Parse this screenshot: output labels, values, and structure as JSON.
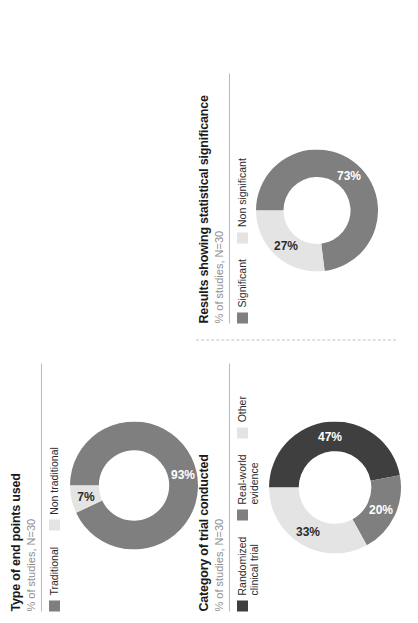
{
  "figure": {
    "orientation": "rotated-90-ccw",
    "background": "#ffffff",
    "colors": {
      "dark": "#3f3f3f",
      "medium": "#7f7f7f",
      "light": "#e4e4e4",
      "title": "#1a1a1a",
      "subtitle": "#8e8e8e",
      "rule": "#b9b9b9",
      "divider": "#c2c2c2"
    }
  },
  "panels": {
    "endpoints": {
      "title": "Type of end points used",
      "subtitle": "% of studies, N=30",
      "legend": [
        {
          "label": "Traditional",
          "color": "#7f7f7f"
        },
        {
          "label": "Non traditional",
          "color": "#e4e4e4"
        }
      ]
    },
    "category": {
      "title": "Category of trial conducted",
      "subtitle": "% of studies, N=30",
      "legend": [
        {
          "label": "Randomized\nclinical trial",
          "color": "#3f3f3f"
        },
        {
          "label": "Real-world\nevidence",
          "color": "#7f7f7f"
        },
        {
          "label": "Other",
          "color": "#e4e4e4"
        }
      ]
    },
    "results": {
      "title": "Results showing statistical significance",
      "subtitle": "% of studies, N=30",
      "legend": [
        {
          "label": "Significant",
          "color": "#7f7f7f"
        },
        {
          "label": "Non significant",
          "color": "#e4e4e4"
        }
      ]
    }
  },
  "chart_data": [
    {
      "type": "pie",
      "id": "endpoints",
      "title": "Type of end points used",
      "subtitle": "% of studies, N=30",
      "donut": true,
      "hole_ratio": 0.55,
      "categories": [
        "Traditional",
        "Non traditional"
      ],
      "values": [
        93,
        7
      ],
      "labels": [
        "93%",
        "7%"
      ],
      "colors": [
        "#7f7f7f",
        "#e4e4e4"
      ],
      "label_colors": [
        "#ffffff",
        "#2b2b2b"
      ],
      "units": "percent",
      "n": 30
    },
    {
      "type": "pie",
      "id": "category",
      "title": "Category of trial conducted",
      "subtitle": "% of studies, N=30",
      "donut": true,
      "hole_ratio": 0.55,
      "categories": [
        "Randomized clinical trial",
        "Real-world evidence",
        "Other"
      ],
      "values": [
        47,
        20,
        33
      ],
      "labels": [
        "47%",
        "20%",
        "33%"
      ],
      "colors": [
        "#3f3f3f",
        "#7f7f7f",
        "#e4e4e4"
      ],
      "label_colors": [
        "#ffffff",
        "#ffffff",
        "#2b2b2b"
      ],
      "units": "percent",
      "n": 30
    },
    {
      "type": "pie",
      "id": "results",
      "title": "Results showing statistical significance",
      "subtitle": "% of studies, N=30",
      "donut": true,
      "hole_ratio": 0.55,
      "categories": [
        "Significant",
        "Non significant"
      ],
      "values": [
        73,
        27
      ],
      "labels": [
        "73%",
        "27%"
      ],
      "colors": [
        "#7f7f7f",
        "#e4e4e4"
      ],
      "label_colors": [
        "#ffffff",
        "#2b2b2b"
      ],
      "units": "percent",
      "n": 30
    }
  ]
}
